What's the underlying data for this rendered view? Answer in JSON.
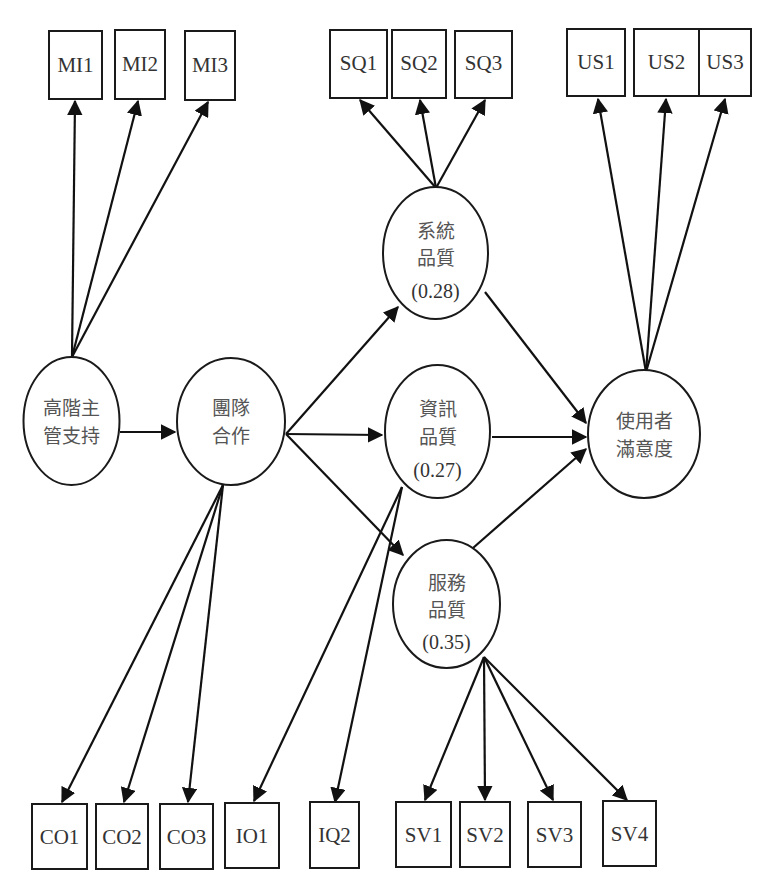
{
  "diagram": {
    "type": "structural-equation-model",
    "latents": {
      "top_management_support": {
        "line1": "高階主",
        "line2": "管支持"
      },
      "teamwork": {
        "line1": "團隊",
        "line2": "合作"
      },
      "system_quality": {
        "line1": "系統",
        "line2": "品質",
        "r2": "(0.28)"
      },
      "information_quality": {
        "line1": "資訊",
        "line2": "品質",
        "r2": "(0.27)"
      },
      "service_quality": {
        "line1": "服務",
        "line2": "品質",
        "r2": "(0.35)"
      },
      "user_satisfaction": {
        "line1": "使用者",
        "line2": "滿意度"
      }
    },
    "indicators": {
      "MI1": "MI1",
      "MI2": "MI2",
      "MI3": "MI3",
      "SQ1": "SQ1",
      "SQ2": "SQ2",
      "SQ3": "SQ3",
      "US1": "US1",
      "US2": "US2",
      "US3": "US3",
      "CO1": "CO1",
      "CO2": "CO2",
      "CO3": "CO3",
      "IO1": "IO1",
      "IQ2": "IQ2",
      "SV1": "SV1",
      "SV2": "SV2",
      "SV3": "SV3",
      "SV4": "SV4"
    },
    "paths": [
      {
        "from": "高階主管支持",
        "to": "團隊合作"
      },
      {
        "from": "團隊合作",
        "to": "系統品質"
      },
      {
        "from": "團隊合作",
        "to": "資訊品質"
      },
      {
        "from": "團隊合作",
        "to": "服務品質"
      },
      {
        "from": "系統品質",
        "to": "使用者滿意度"
      },
      {
        "from": "資訊品質",
        "to": "使用者滿意度"
      },
      {
        "from": "服務品質",
        "to": "使用者滿意度"
      }
    ],
    "colors": {
      "stroke": "#1a1a1a",
      "text": "#333333",
      "background": "#ffffff"
    }
  }
}
